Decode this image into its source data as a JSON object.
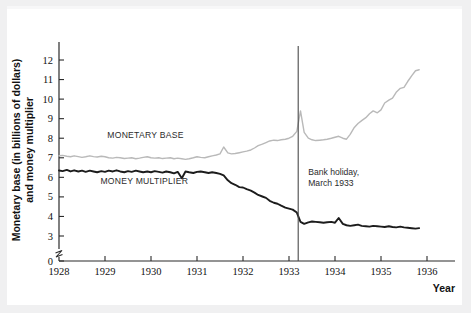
{
  "chart_data": {
    "type": "line",
    "title": "",
    "xlabel": "Year",
    "ylabel": "Monetary base (in billions of dollars)\nand money multiplier",
    "ylabel_line1": "Monetary base (in billions of dollars)",
    "ylabel_line2": "and money multiplier",
    "xlim": [
      1928,
      1936
    ],
    "ylim": [
      3,
      12
    ],
    "y_axis_break_at": 0,
    "grid": false,
    "legend_position": "inline-annotations",
    "x_tick_labels": [
      "1928",
      "1929",
      "1930",
      "1931",
      "1932",
      "1933",
      "1934",
      "1935",
      "1936"
    ],
    "x_ticks": [
      1928,
      1929,
      1930,
      1931,
      1932,
      1933,
      1934,
      1935,
      1936
    ],
    "y_tick_labels": [
      "0",
      "3",
      "4",
      "5",
      "6",
      "7",
      "8",
      "9",
      "10",
      "11",
      "12"
    ],
    "y_ticks": [
      0,
      3,
      4,
      5,
      6,
      7,
      8,
      9,
      10,
      11,
      12
    ],
    "annotations": [
      {
        "name": "bank-holiday-marker",
        "label_line1": "Bank holiday,",
        "label_line2": "March 1933",
        "x": 1933.2,
        "type": "vertical-line"
      }
    ],
    "series": [
      {
        "name": "MONETARY BASE",
        "color": "#b9b9b9",
        "label_x": 1929.05,
        "label_y": 8.0,
        "x": [
          1928.0,
          1928.08,
          1928.17,
          1928.25,
          1928.33,
          1928.42,
          1928.5,
          1928.58,
          1928.67,
          1928.75,
          1928.83,
          1928.92,
          1929.0,
          1929.08,
          1929.17,
          1929.25,
          1929.33,
          1929.42,
          1929.5,
          1929.58,
          1929.67,
          1929.75,
          1929.83,
          1929.92,
          1930.0,
          1930.08,
          1930.17,
          1930.25,
          1930.33,
          1930.42,
          1930.5,
          1930.58,
          1930.67,
          1930.75,
          1930.83,
          1930.92,
          1931.0,
          1931.08,
          1931.17,
          1931.25,
          1931.33,
          1931.42,
          1931.5,
          1931.58,
          1931.67,
          1931.75,
          1931.83,
          1931.92,
          1932.0,
          1932.08,
          1932.17,
          1932.25,
          1932.33,
          1932.42,
          1932.5,
          1932.58,
          1932.67,
          1932.75,
          1932.83,
          1932.92,
          1933.0,
          1933.08,
          1933.17,
          1933.25,
          1933.33,
          1933.42,
          1933.5,
          1933.58,
          1933.67,
          1933.75,
          1933.83,
          1933.92,
          1934.0,
          1934.08,
          1934.17,
          1934.25,
          1934.33,
          1934.42,
          1934.5,
          1934.58,
          1934.67,
          1934.75,
          1934.83,
          1934.92,
          1935.0,
          1935.08,
          1935.17,
          1935.25,
          1935.33,
          1935.42,
          1935.5,
          1935.58,
          1935.67,
          1935.75,
          1935.83
        ],
        "y": [
          7.1,
          7.12,
          7.08,
          7.05,
          7.1,
          7.06,
          7.02,
          7.05,
          7.1,
          7.06,
          7.04,
          7.08,
          7.05,
          7.0,
          6.98,
          7.02,
          7.0,
          6.96,
          6.98,
          7.0,
          6.95,
          6.98,
          7.02,
          7.05,
          7.0,
          6.98,
          7.0,
          6.96,
          6.98,
          7.0,
          6.95,
          6.98,
          6.95,
          6.92,
          6.95,
          7.0,
          7.05,
          7.02,
          7.0,
          7.05,
          7.1,
          7.14,
          7.2,
          7.55,
          7.25,
          7.2,
          7.22,
          7.26,
          7.3,
          7.34,
          7.4,
          7.5,
          7.62,
          7.7,
          7.78,
          7.86,
          7.9,
          7.88,
          7.92,
          7.95,
          8.0,
          8.1,
          8.35,
          9.4,
          8.3,
          8.0,
          7.92,
          7.88,
          7.9,
          7.92,
          7.95,
          8.0,
          8.05,
          8.1,
          8.0,
          7.95,
          8.2,
          8.55,
          8.75,
          8.9,
          9.05,
          9.25,
          9.4,
          9.3,
          9.45,
          9.8,
          9.95,
          10.05,
          10.35,
          10.55,
          10.6,
          10.9,
          11.2,
          11.45,
          11.5
        ]
      },
      {
        "name": "MONEY MULTIPLIER",
        "color": "#1c1c1c",
        "label_x": 1928.9,
        "label_y": 5.65,
        "x": [
          1928.0,
          1928.08,
          1928.17,
          1928.25,
          1928.33,
          1928.42,
          1928.5,
          1928.58,
          1928.67,
          1928.75,
          1928.83,
          1928.92,
          1929.0,
          1929.08,
          1929.17,
          1929.25,
          1929.33,
          1929.42,
          1929.5,
          1929.58,
          1929.67,
          1929.75,
          1929.83,
          1929.92,
          1930.0,
          1930.08,
          1930.17,
          1930.25,
          1930.33,
          1930.42,
          1930.5,
          1930.58,
          1930.67,
          1930.75,
          1930.83,
          1930.92,
          1931.0,
          1931.08,
          1931.17,
          1931.25,
          1931.33,
          1931.42,
          1931.5,
          1931.58,
          1931.67,
          1931.75,
          1931.83,
          1931.92,
          1932.0,
          1932.08,
          1932.17,
          1932.25,
          1932.33,
          1932.42,
          1932.5,
          1932.58,
          1932.67,
          1932.75,
          1932.83,
          1932.92,
          1933.0,
          1933.08,
          1933.17,
          1933.25,
          1933.33,
          1933.42,
          1933.5,
          1933.58,
          1933.67,
          1933.75,
          1933.83,
          1933.92,
          1934.0,
          1934.08,
          1934.17,
          1934.25,
          1934.33,
          1934.42,
          1934.5,
          1934.58,
          1934.67,
          1934.75,
          1934.83,
          1934.92,
          1935.0,
          1935.08,
          1935.17,
          1935.25,
          1935.33,
          1935.42,
          1935.5,
          1935.58,
          1935.67,
          1935.75,
          1935.83
        ],
        "y": [
          6.35,
          6.32,
          6.38,
          6.3,
          6.36,
          6.3,
          6.34,
          6.28,
          6.34,
          6.3,
          6.26,
          6.32,
          6.28,
          6.34,
          6.3,
          6.36,
          6.3,
          6.26,
          6.32,
          6.28,
          6.34,
          6.3,
          6.26,
          6.3,
          6.26,
          6.32,
          6.28,
          6.24,
          6.3,
          6.26,
          6.2,
          6.28,
          5.95,
          6.3,
          6.26,
          6.22,
          6.28,
          6.3,
          6.26,
          6.22,
          6.26,
          6.22,
          6.18,
          6.1,
          5.85,
          5.7,
          5.62,
          5.5,
          5.48,
          5.4,
          5.32,
          5.22,
          5.1,
          5.02,
          4.95,
          4.8,
          4.7,
          4.65,
          4.55,
          4.45,
          4.4,
          4.35,
          4.2,
          3.72,
          3.62,
          3.7,
          3.74,
          3.72,
          3.7,
          3.68,
          3.7,
          3.72,
          3.68,
          3.92,
          3.62,
          3.55,
          3.52,
          3.55,
          3.58,
          3.52,
          3.5,
          3.48,
          3.52,
          3.5,
          3.48,
          3.46,
          3.5,
          3.46,
          3.44,
          3.48,
          3.44,
          3.42,
          3.4,
          3.38,
          3.4
        ]
      }
    ]
  }
}
